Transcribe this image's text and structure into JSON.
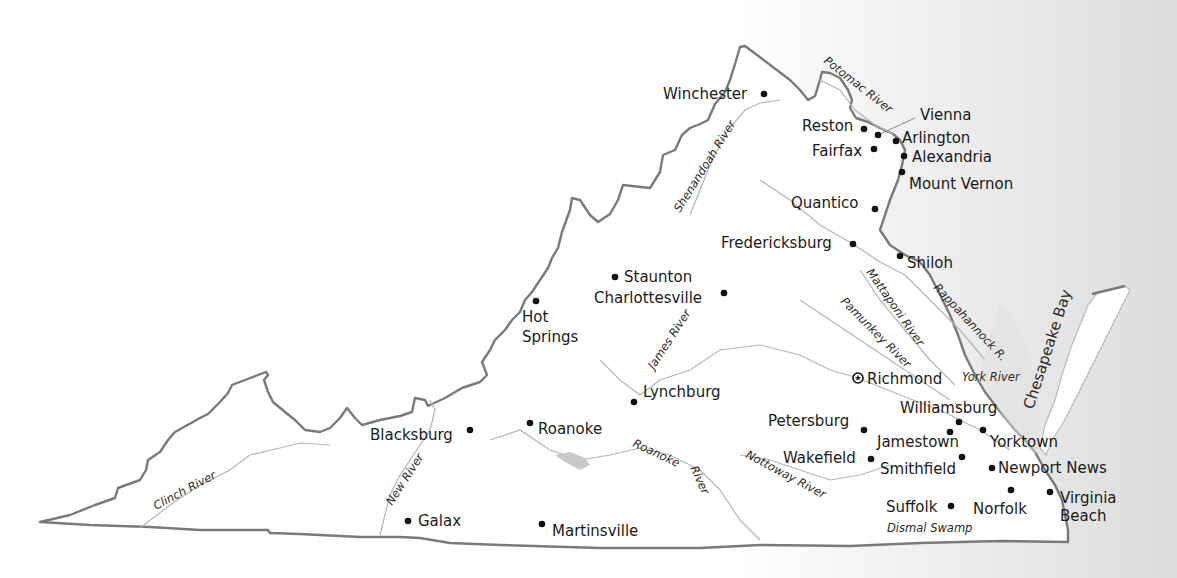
{
  "map": {
    "title": "Virginia",
    "colors": {
      "border": "#7a7a7a",
      "river": "#b5b5b5",
      "water_bg": "#dcdcdc",
      "text": "#1a1a1a"
    },
    "cities": [
      {
        "name": "Winchester",
        "x": 764,
        "y": 94
      },
      {
        "name": "Reston",
        "x": 864,
        "y": 129
      },
      {
        "name": "Vienna",
        "x": 878,
        "y": 134
      },
      {
        "name": "Arlington",
        "x": 896,
        "y": 141
      },
      {
        "name": "Fairfax",
        "x": 874,
        "y": 149
      },
      {
        "name": "Alexandria",
        "x": 904,
        "y": 156
      },
      {
        "name": "Mount Vernon",
        "x": 902,
        "y": 172
      },
      {
        "name": "Quantico",
        "x": 875,
        "y": 209
      },
      {
        "name": "Fredericksburg",
        "x": 853,
        "y": 244
      },
      {
        "name": "Shiloh",
        "x": 900,
        "y": 256
      },
      {
        "name": "Staunton",
        "x": 615,
        "y": 277
      },
      {
        "name": "Charlottesville",
        "x": 724,
        "y": 293
      },
      {
        "name": "Hot Springs",
        "x": 536,
        "y": 301
      },
      {
        "name": "Richmond",
        "x": 858,
        "y": 378,
        "capital": true
      },
      {
        "name": "Lynchburg",
        "x": 634,
        "y": 402
      },
      {
        "name": "Williamsburg",
        "x": 959,
        "y": 422
      },
      {
        "name": "Petersburg",
        "x": 864,
        "y": 430
      },
      {
        "name": "Jamestown",
        "x": 950,
        "y": 432
      },
      {
        "name": "Yorktown",
        "x": 983,
        "y": 430
      },
      {
        "name": "Blacksburg",
        "x": 470,
        "y": 430
      },
      {
        "name": "Roanoke",
        "x": 530,
        "y": 423
      },
      {
        "name": "Wakefield",
        "x": 871,
        "y": 459
      },
      {
        "name": "Smithfield",
        "x": 962,
        "y": 457
      },
      {
        "name": "Newport News",
        "x": 992,
        "y": 468
      },
      {
        "name": "Norfolk",
        "x": 1011,
        "y": 490
      },
      {
        "name": "Virginia Beach",
        "x": 1050,
        "y": 492
      },
      {
        "name": "Suffolk",
        "x": 951,
        "y": 506
      },
      {
        "name": "Galax",
        "x": 408,
        "y": 521
      },
      {
        "name": "Martinsville",
        "x": 542,
        "y": 524
      }
    ],
    "rivers": [
      "Potomac River",
      "Shenandoah River",
      "Mattaponi River",
      "Rappahannock R.",
      "Pamunkey River",
      "York River",
      "James River",
      "Roanoke River",
      "Nottoway River",
      "New River",
      "Clinch River"
    ],
    "features": [
      "Chesapeake Bay",
      "Dismal Swamp"
    ]
  },
  "labels": {
    "winchester": "Winchester",
    "reston": "Reston",
    "vienna": "Vienna",
    "arlington": "Arlington",
    "fairfax": "Fairfax",
    "alexandria": "Alexandria",
    "mount_vernon": "Mount Vernon",
    "quantico": "Quantico",
    "fredericksburg": "Fredericksburg",
    "shiloh": "Shiloh",
    "staunton": "Staunton",
    "charlottesville": "Charlottesville",
    "hot": "Hot",
    "springs": "Springs",
    "richmond": "Richmond",
    "lynchburg": "Lynchburg",
    "williamsburg": "Williamsburg",
    "petersburg": "Petersburg",
    "jamestown": "Jamestown",
    "yorktown": "Yorktown",
    "blacksburg": "Blacksburg",
    "roanoke": "Roanoke",
    "wakefield": "Wakefield",
    "smithfield": "Smithfield",
    "newport_news": "Newport News",
    "norfolk": "Norfolk",
    "virginia": "Virginia",
    "beach": "Beach",
    "suffolk": "Suffolk",
    "galax": "Galax",
    "martinsville": "Martinsville",
    "potomac": "Potomac River",
    "shenandoah": "Shenandoah River",
    "mattaponi": "Mattaponi River",
    "rappahannock": "Rappahannock R.",
    "pamunkey": "Pamunkey River",
    "york": "York River",
    "james": "James River",
    "roanoke_river_1": "Roanoke",
    "roanoke_river_2": "River",
    "nottoway": "Nottoway River",
    "new_river": "New River",
    "clinch": "Clinch River",
    "chesapeake": "Chesapeake Bay",
    "dismal": "Dismal Swamp"
  }
}
